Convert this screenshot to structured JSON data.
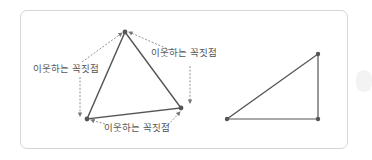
{
  "figure": {
    "labels": {
      "left": "이웃하는 꼭짓점",
      "right": "이웃하는 꼭짓점",
      "bottom": "이웃하는 꼭짓점"
    },
    "colors": {
      "edge": "#555555",
      "dashed": "#888888",
      "vertex": "#555555",
      "border": "#d6d6d6"
    },
    "triangle_with_neighbors": {
      "vertices": [
        [
          125,
          32
        ],
        [
          181,
          108
        ],
        [
          87,
          119
        ]
      ]
    },
    "right_triangle": {
      "vertices": [
        [
          318,
          54
        ],
        [
          227,
          119
        ],
        [
          318,
          119
        ]
      ]
    }
  }
}
